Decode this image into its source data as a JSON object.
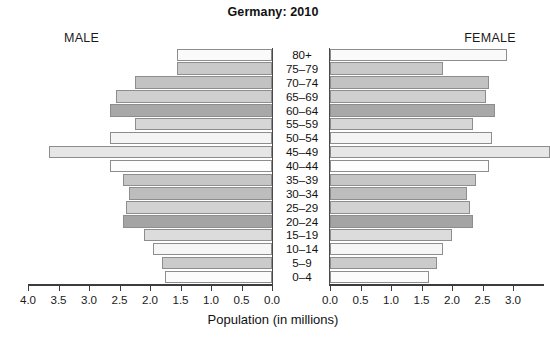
{
  "chart_data": {
    "type": "bar",
    "subtype": "population-pyramid",
    "title": "Germany: 2010",
    "xlabel": "Population (in millions)",
    "ylabel": "",
    "grid": false,
    "legend": "none",
    "left_label": "MALE",
    "right_label": "FEMALE",
    "xlim": [
      0,
      4.0
    ],
    "xticks": [
      0.0,
      0.5,
      1.0,
      1.5,
      2.0,
      2.5,
      3.0,
      3.5,
      4.0
    ],
    "left_tick_labels": [
      "4.0",
      "3.5",
      "3.0",
      "2.5",
      "2.0",
      "1.5",
      "1.0",
      "0.5",
      "0.0"
    ],
    "right_tick_labels": [
      "0.0",
      "0.5",
      "1.0",
      "1.5",
      "2.0",
      "2.5",
      "3.0",
      "3.5",
      "4.0"
    ],
    "categories": [
      "80+",
      "75–79",
      "70–74",
      "65–69",
      "60–64",
      "55–59",
      "50–54",
      "45–49",
      "40–44",
      "35–39",
      "30–34",
      "25–29",
      "20–24",
      "15–19",
      "10–14",
      "5–9",
      "0–4"
    ],
    "series": [
      {
        "name": "MALE",
        "side": "left",
        "values": [
          1.55,
          1.55,
          2.25,
          2.55,
          2.65,
          2.25,
          2.65,
          3.65,
          2.65,
          2.45,
          2.35,
          2.4,
          2.45,
          2.1,
          1.95,
          1.8,
          1.75
        ]
      },
      {
        "name": "FEMALE",
        "side": "right",
        "values": [
          2.9,
          1.85,
          2.6,
          2.55,
          2.7,
          2.35,
          2.65,
          3.6,
          2.6,
          2.4,
          2.25,
          2.3,
          2.35,
          2.0,
          1.85,
          1.75,
          1.62
        ]
      }
    ],
    "bar_colors": [
      "#fafafa",
      "#c9c9c9",
      "#c2c2c2",
      "#cfcfcf",
      "#a8a8a8",
      "#d6d6d6",
      "#f4f4f4",
      "#e6e6e6",
      "#fdfdfd",
      "#c6c6c6",
      "#bdbdbd",
      "#d2d2d2",
      "#a4a4a4",
      "#dcdcdc",
      "#f6f6f6",
      "#cbcbcb",
      "#fbfbfb"
    ],
    "bar_outline_color": "#8d8d8d",
    "axis_color": "#3c3c3c",
    "background_color": "#ffffff"
  }
}
